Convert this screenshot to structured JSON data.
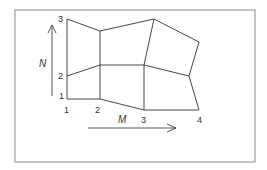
{
  "diagram": {
    "frame": {
      "x": 15,
      "y": 10,
      "w": 240,
      "h": 152
    },
    "colors": {
      "line": "#333333",
      "frame": "#8a8a8a",
      "background": "#ffffff"
    },
    "nodes": [
      {
        "i": 1,
        "j": 1,
        "x": 67,
        "y": 99
      },
      {
        "i": 1,
        "j": 2,
        "x": 67,
        "y": 76
      },
      {
        "i": 1,
        "j": 3,
        "x": 67,
        "y": 19
      },
      {
        "i": 2,
        "j": 1,
        "x": 100,
        "y": 99
      },
      {
        "i": 2,
        "j": 2,
        "x": 100,
        "y": 65
      },
      {
        "i": 2,
        "j": 3,
        "x": 100,
        "y": 31
      },
      {
        "i": 3,
        "j": 1,
        "x": 144,
        "y": 110
      },
      {
        "i": 3,
        "j": 2,
        "x": 144,
        "y": 65
      },
      {
        "i": 3,
        "j": 3,
        "x": 154,
        "y": 19
      },
      {
        "i": 4,
        "j": 1,
        "x": 199,
        "y": 110
      },
      {
        "i": 4,
        "j": 2,
        "x": 189,
        "y": 76
      },
      {
        "i": 4,
        "j": 3,
        "x": 199,
        "y": 42
      }
    ],
    "m_labels": [
      {
        "text": "1",
        "x": 64,
        "y": 113
      },
      {
        "text": "2",
        "x": 95,
        "y": 113
      },
      {
        "text": "3",
        "x": 141,
        "y": 123
      },
      {
        "text": "4",
        "x": 197,
        "y": 123
      }
    ],
    "n_labels": [
      {
        "text": "1",
        "x": 59,
        "y": 99
      },
      {
        "text": "2",
        "x": 58,
        "y": 79
      },
      {
        "text": "3",
        "x": 58,
        "y": 22
      }
    ],
    "axis_m": {
      "label": "M",
      "label_x": 118,
      "label_y": 123,
      "x1": 88,
      "y1": 128,
      "x2": 176,
      "y2": 128
    },
    "axis_n": {
      "label": "N",
      "label_x": 39,
      "label_y": 67,
      "x1": 52,
      "y1": 96,
      "x2": 52,
      "y2": 25
    }
  }
}
